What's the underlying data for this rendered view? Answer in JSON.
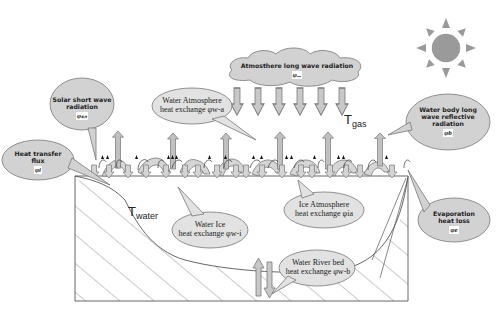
{
  "diagram": {
    "colors": {
      "bubble_fill": "#d2d2d2",
      "bubble_stroke": "#777777",
      "arrow_fill": "#c8c8c8",
      "arrow_stroke": "#7a7a7a",
      "sun": "#9a9a9a",
      "line": "#555555"
    },
    "icons": {
      "sun": "sun-icon"
    },
    "labels": {
      "atmosphere": {
        "text": "Atmosthere long wave radiation",
        "symbol": "φₐₐ"
      },
      "solar": {
        "line1": "Solar short wave",
        "line2": "radiation",
        "symbol": "φₛₙ"
      },
      "water_atmo": {
        "line1": "Water Atmosphere",
        "line2": "heat exchange φw-a"
      },
      "water_body": {
        "line1": "Water body long",
        "line2": "wave reflective",
        "line3": "radiation",
        "symbol": "φb"
      },
      "heat_transfer": {
        "line1": "Heat transfer",
        "line2": "flux",
        "symbol": "φi"
      },
      "water_ice": {
        "line1": "Water Ice",
        "line2": "heat exchange φw-i"
      },
      "ice_atmo": {
        "line1": "Ice Atmosphere",
        "line2": "heat exchange φia"
      },
      "evaporation": {
        "line1": "Evaporation",
        "line2": "heat loss",
        "symbol": "φe"
      },
      "river_bed": {
        "line1": "Water River bed",
        "line2": "heat exchange φw-b"
      }
    },
    "variables": {
      "t_gas": {
        "base": "T",
        "sub": "gas"
      },
      "t_water": {
        "base": "T",
        "sub": "water"
      }
    }
  }
}
